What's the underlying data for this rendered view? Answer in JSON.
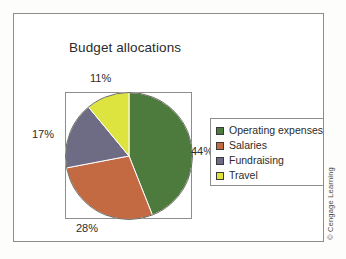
{
  "figure": {
    "title": "Budget allocations",
    "credit": "© Cengage Learning"
  },
  "chart_data": {
    "type": "pie",
    "title": "Budget allocations",
    "xlabel": "",
    "ylabel": "",
    "categories": [
      "Operating expenses",
      "Salaries",
      "Fundraising",
      "Travel"
    ],
    "values": [
      44,
      28,
      17,
      11
    ],
    "value_unit": "percent",
    "data_labels": [
      "44%",
      "28%",
      "17%",
      "11%"
    ],
    "colors": [
      "#4d7a3d",
      "#c46a42",
      "#6e6b85",
      "#dde33f"
    ],
    "legend": {
      "position": "right",
      "entries": [
        {
          "label": "Operating expenses",
          "color": "#4d7a3d",
          "value": 44
        },
        {
          "label": "Salaries",
          "color": "#c46a42",
          "value": 28
        },
        {
          "label": "Fundraising",
          "color": "#6e6b85",
          "value": 17
        },
        {
          "label": "Travel",
          "color": "#dde33f",
          "value": 11
        }
      ]
    },
    "start_angle_deg": 0,
    "direction": "clockwise",
    "grid": false,
    "callouts": {
      "top": "11%",
      "left": "17%",
      "right": "44%",
      "bottom": "28%"
    }
  }
}
